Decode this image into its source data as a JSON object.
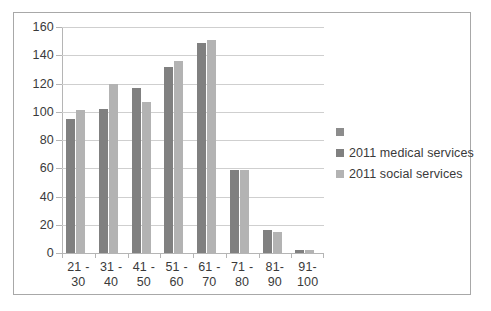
{
  "chart_data": {
    "type": "bar",
    "title": "",
    "xlabel": "",
    "ylabel": "",
    "categories": [
      "21 - 30",
      "31 - 40",
      "41 - 50",
      "51 - 60",
      "61 - 70",
      "71 - 80",
      "81- 90",
      "91- 100"
    ],
    "category_lines": [
      {
        "lo": "21 -",
        "hi": "30"
      },
      {
        "lo": "31 -",
        "hi": "40"
      },
      {
        "lo": "41 -",
        "hi": "50"
      },
      {
        "lo": "51 -",
        "hi": "60"
      },
      {
        "lo": "61 -",
        "hi": "70"
      },
      {
        "lo": "71 -",
        "hi": "80"
      },
      {
        "lo": "81-",
        "hi": "90"
      },
      {
        "lo": "91-",
        "hi": "100"
      }
    ],
    "series": [
      {
        "name": "2011 medical services",
        "color": "#808080",
        "values": [
          95,
          102,
          117,
          132,
          149,
          59,
          16,
          2
        ]
      },
      {
        "name": "2011 social services",
        "color": "#b3b3b3",
        "values": [
          101,
          120,
          107,
          136,
          151,
          59,
          15,
          2
        ]
      }
    ],
    "ylim": [
      0,
      160
    ],
    "ytick_step": 20,
    "yticks": [
      0,
      20,
      40,
      60,
      80,
      100,
      120,
      140,
      160
    ],
    "ytick_labels": [
      "0",
      "20",
      "40",
      "60",
      "80",
      "100",
      "120",
      "140",
      "160"
    ],
    "grid": true,
    "legend_position": "right"
  },
  "legend": {
    "entries": [
      {
        "label": "",
        "color": "#8c8c8c"
      },
      {
        "label": "2011 medical services",
        "color": "#808080"
      },
      {
        "label": "2011 social services",
        "color": "#b3b3b3"
      }
    ]
  },
  "colors": {
    "medical": "#808080",
    "social": "#b3b3b3",
    "grid": "#cfcfcf",
    "axis": "#b5b5b5",
    "frame": "#a8a8a8",
    "text": "#3a3a3a",
    "background": "#ffffff"
  }
}
